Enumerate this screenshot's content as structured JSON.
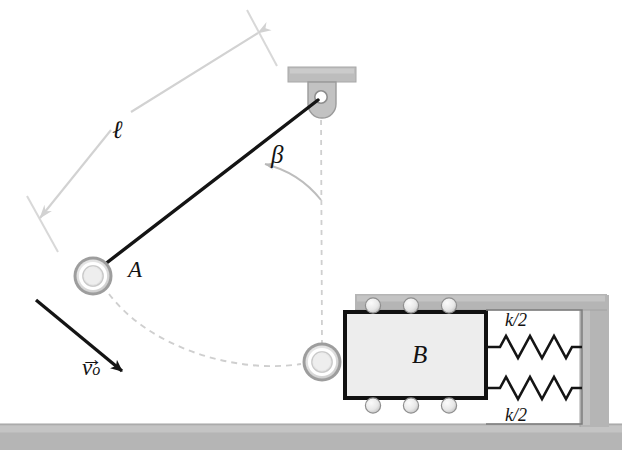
{
  "figure": {
    "labels": {
      "length": "ℓ",
      "angle": "β",
      "ball_a": "A",
      "block_b": "B",
      "velocity_symbol": "v",
      "velocity_arrow": "→",
      "velocity_subscript": "o",
      "spring_top": "k/2",
      "spring_bottom": "k/2"
    },
    "colors": {
      "rod": "#141414",
      "block_outline": "#111111",
      "block_fill": "#ededed",
      "support_gray": "#b3b3b3",
      "wall_gray": "#b0b0b0",
      "ball_ring": "#8f8f8f",
      "ball_core": "#e3e3e3",
      "dimension_gray": "#d2d2d2",
      "dashed_path": "#cfcfcf",
      "spring_stroke": "#141414",
      "roller_fill": "#ececec",
      "background": "#ffffff"
    },
    "geometry": {
      "pivot": {
        "x": 321,
        "y": 97
      },
      "ball_a": {
        "x": 93,
        "y": 276,
        "outer_r": 19
      },
      "ball_low": {
        "x": 322,
        "y": 362,
        "outer_r": 19
      },
      "block": {
        "x": 345,
        "y": 312,
        "w": 141,
        "h": 86
      },
      "rollers_top": 3,
      "rollers_bottom": 3,
      "springs": 2
    }
  }
}
